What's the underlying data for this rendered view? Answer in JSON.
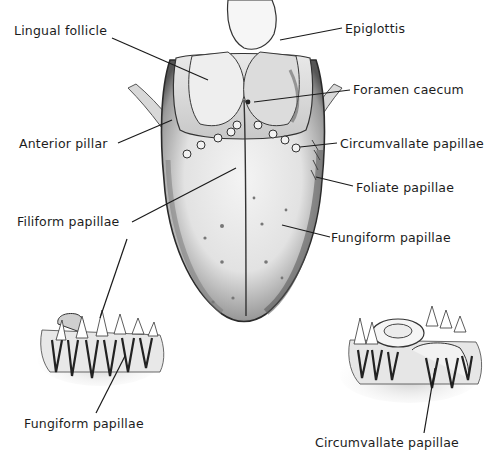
{
  "figure": {
    "labels": {
      "lingual_follicle": "Lingual follicle",
      "epiglottis": "Epiglottis",
      "foramen_caecum": "Foramen caecum",
      "anterior_pillar": "Anterior pillar",
      "circumvallate_papillae": "Circumvallate papillae",
      "foliate_papillae": "Foliate papillae",
      "filiform_papillae": "Filiform papillae",
      "fungiform_papillae": "Fungiform papillae",
      "fungiform_papillae_detail": "Fungiform papillae",
      "circumvallate_papillae_detail": "Circumvallate papillae"
    },
    "colors": {
      "line": "#1a1a1a",
      "ink_dark": "#2a2a2a",
      "shade_mid": "#8a8a8a",
      "shade_light": "#d4d4d4",
      "background": "#ffffff"
    }
  }
}
